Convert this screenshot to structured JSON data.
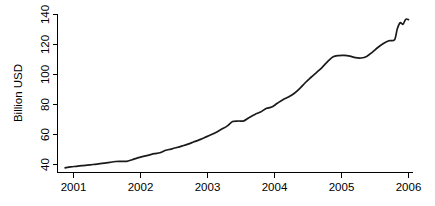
{
  "chart_data": {
    "type": "line",
    "title": "",
    "subtitle": "",
    "xlabel": "",
    "ylabel": "Billion USD",
    "xlim": [
      2000.83,
      2006.0
    ],
    "ylim": [
      36.5,
      141.0
    ],
    "grid": false,
    "legend": null,
    "legend_position": "none",
    "x_ticks": [
      2001,
      2002,
      2003,
      2004,
      2005,
      2006
    ],
    "x_tick_labels": [
      "2001",
      "2002",
      "2003",
      "2004",
      "2005",
      "2006"
    ],
    "y_ticks": [
      40,
      60,
      80,
      100,
      120,
      140
    ],
    "y_tick_labels": [
      "40",
      "60",
      "80",
      "100",
      "120",
      "140"
    ],
    "line_color": "#1a1a1a",
    "series": [
      {
        "name": "Billion USD",
        "x": [
          2000.875,
          2000.958,
          2001.042,
          2001.125,
          2001.208,
          2001.292,
          2001.375,
          2001.458,
          2001.542,
          2001.625,
          2001.708,
          2001.792,
          2001.875,
          2001.958,
          2002.042,
          2002.125,
          2002.208,
          2002.292,
          2002.375,
          2002.458,
          2002.542,
          2002.625,
          2002.708,
          2002.792,
          2002.875,
          2002.958,
          2003.042,
          2003.125,
          2003.208,
          2003.292,
          2003.375,
          2003.458,
          2003.542,
          2003.625,
          2003.708,
          2003.792,
          2003.875,
          2003.958,
          2004.042,
          2004.125,
          2004.208,
          2004.292,
          2004.375,
          2004.458,
          2004.542,
          2004.625,
          2004.708,
          2004.792,
          2004.875,
          2004.958,
          2005.042,
          2005.125,
          2005.208,
          2005.292,
          2005.375,
          2005.458,
          2005.542,
          2005.625,
          2005.708,
          2005.792
        ],
        "values": [
          37.8,
          38.4,
          38.8,
          39.2,
          39.6,
          40.0,
          40.4,
          40.9,
          41.4,
          42.0,
          42.1,
          42.1,
          43.2,
          44.4,
          45.4,
          46.3,
          47.2,
          47.8,
          49.5,
          50.3,
          51.3,
          52.4,
          53.6,
          55.0,
          56.4,
          58.0,
          59.6,
          61.4,
          63.5,
          65.6,
          68.6,
          69.0,
          69.1,
          71.4,
          73.4,
          75.0,
          77.3,
          78.3,
          80.8,
          83.2,
          85.0,
          87.3,
          90.6,
          94.5,
          98.0,
          101.3,
          104.6,
          108.6,
          111.8,
          112.6,
          112.7,
          112.2,
          111.2,
          111.0,
          112.0,
          114.8,
          118.0,
          120.6,
          122.5,
          123.2
        ]
      }
    ],
    "series_extra": {
      "name": "Billion USD (continued)",
      "x": [
        2005.792,
        2005.833,
        2005.875,
        2005.917,
        2005.958,
        2006.0
      ],
      "values": [
        123.2,
        130.5,
        134.5,
        133.5,
        136.8,
        136.6
      ]
    },
    "annotations": []
  },
  "axes": {
    "y_axis_title": "Billion USD",
    "x_axis_title": ""
  }
}
